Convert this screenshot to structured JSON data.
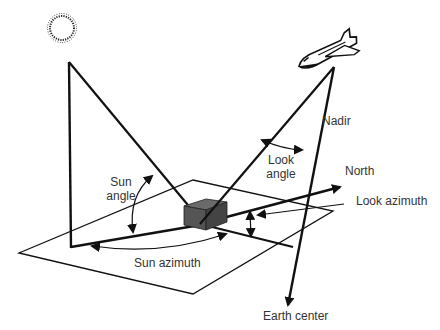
{
  "diagram": {
    "type": "remote-sensing-geometry",
    "colors": {
      "stroke": "#111111",
      "cube_front": "#555555",
      "cube_top": "#6a6a6a",
      "cube_side": "#444444",
      "text": "#333333"
    },
    "icons": {
      "sun": "sun-icon",
      "satellite": "space-shuttle-icon",
      "target": "ground-target-cube-icon"
    },
    "labels": {
      "nadir": "Nadir",
      "look_angle_line1": "Look",
      "look_angle_line2": "angle",
      "north": "North",
      "look_azimuth": "Look azimuth",
      "sun_angle_line1": "Sun",
      "sun_angle_line2": "angle",
      "sun_azimuth": "Sun azimuth",
      "earth_center": "Earth center"
    }
  }
}
